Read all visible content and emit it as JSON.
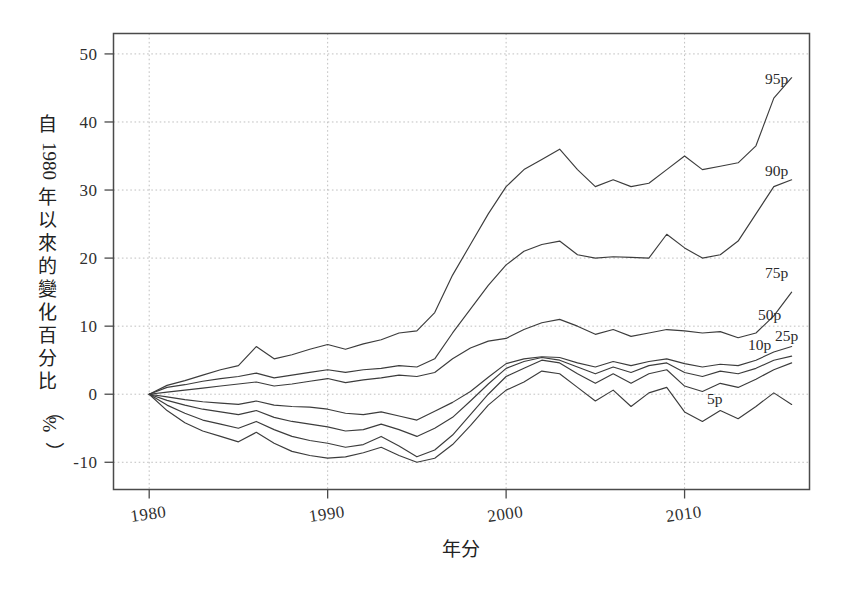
{
  "chart_data": {
    "type": "line",
    "title": "",
    "xlabel": "年分",
    "ylabel": "自 1980 年以來的變化百分比（%）",
    "ylabel_chars": [
      "自",
      "1",
      "9",
      "8",
      "0",
      "年",
      "以",
      "來",
      "的",
      "變",
      "化",
      "百",
      "分",
      "比",
      "（",
      "%",
      "）"
    ],
    "xlim": [
      1979,
      1980.5
    ],
    "x_axis_range": [
      1978.0,
      1519.0
    ],
    "xlim_years": [
      1978,
      2017
    ],
    "ylim": [
      -14,
      53
    ],
    "grid": true,
    "legend_position": "right-inline",
    "xticks": [
      1980,
      1990,
      2000,
      2010
    ],
    "xtick_labels": [
      "1980",
      "1990",
      "2000",
      "2010"
    ],
    "yticks": [
      -10,
      0,
      10,
      20,
      30,
      40,
      50
    ],
    "ytick_labels": [
      "-10",
      "0",
      "10",
      "20",
      "30",
      "40",
      "50"
    ],
    "x": [
      1980,
      1981,
      1982,
      1983,
      1984,
      1985,
      1986,
      1987,
      1988,
      1989,
      1990,
      1991,
      1992,
      1993,
      1994,
      1995,
      1996,
      1997,
      1998,
      1999,
      2000,
      2001,
      2002,
      2003,
      2004,
      2005,
      2006,
      2007,
      2008,
      2009,
      2010,
      2011,
      2012,
      2013,
      2014,
      2015,
      2016
    ],
    "series": [
      {
        "name": "95p",
        "label": "95p",
        "label_value": 46.5,
        "values": [
          0,
          1.3,
          2.0,
          2.8,
          3.6,
          4.2,
          7.0,
          5.2,
          5.8,
          6.6,
          7.3,
          6.6,
          7.4,
          8.0,
          9.0,
          9.3,
          12.0,
          17.5,
          22.0,
          26.5,
          30.5,
          33.0,
          34.5,
          36.0,
          33.0,
          30.5,
          31.5,
          30.5,
          31.0,
          33.0,
          35.0,
          33.0,
          33.5,
          34.0,
          36.5,
          43.5,
          46.5
        ]
      },
      {
        "name": "90p",
        "label": "90p",
        "label_value": 31.5,
        "values": [
          0,
          1.0,
          1.4,
          1.9,
          2.3,
          2.6,
          3.1,
          2.4,
          2.8,
          3.2,
          3.6,
          3.2,
          3.6,
          3.8,
          4.2,
          4.0,
          5.2,
          9.0,
          12.5,
          16.0,
          19.0,
          21.0,
          22.0,
          22.5,
          20.5,
          20.0,
          20.2,
          20.1,
          20.0,
          23.5,
          21.5,
          20.0,
          20.5,
          22.5,
          26.5,
          30.5,
          31.5
        ]
      },
      {
        "name": "75p",
        "label": "75p",
        "label_value": 15.0,
        "values": [
          0,
          0.3,
          0.6,
          0.9,
          1.2,
          1.5,
          1.8,
          1.2,
          1.5,
          1.9,
          2.3,
          1.7,
          2.1,
          2.4,
          2.8,
          2.6,
          3.2,
          5.2,
          6.8,
          7.8,
          8.2,
          9.5,
          10.5,
          11.0,
          10.0,
          8.8,
          9.5,
          8.5,
          9.0,
          9.5,
          9.3,
          9.0,
          9.2,
          8.3,
          9.0,
          11.5,
          15.0
        ]
      },
      {
        "name": "50p",
        "label": "50p",
        "label_value": 7.0,
        "values": [
          0,
          -0.4,
          -0.8,
          -1.1,
          -1.3,
          -1.5,
          -1.0,
          -1.6,
          -1.8,
          -1.9,
          -2.2,
          -2.8,
          -3.0,
          -2.6,
          -3.2,
          -3.8,
          -2.5,
          -1.2,
          0.4,
          2.5,
          4.5,
          5.2,
          5.5,
          5.4,
          4.6,
          4.0,
          4.8,
          4.2,
          4.8,
          5.2,
          4.5,
          4.0,
          4.4,
          4.2,
          5.0,
          6.2,
          7.0
        ]
      },
      {
        "name": "25p",
        "label": "25p",
        "label_value": 5.6,
        "values": [
          0,
          -0.9,
          -1.6,
          -2.2,
          -2.6,
          -3.0,
          -2.4,
          -3.4,
          -4.0,
          -4.4,
          -4.8,
          -5.4,
          -5.2,
          -4.4,
          -5.2,
          -6.2,
          -5.0,
          -3.4,
          -1.0,
          1.5,
          3.8,
          4.8,
          5.4,
          5.0,
          4.0,
          3.0,
          4.0,
          3.2,
          4.2,
          4.6,
          3.2,
          2.6,
          3.4,
          3.0,
          3.8,
          5.0,
          5.6
        ]
      },
      {
        "name": "10p",
        "label": "10p",
        "label_value": 4.6,
        "values": [
          0,
          -1.6,
          -2.8,
          -3.8,
          -4.4,
          -5.0,
          -4.0,
          -5.2,
          -6.2,
          -6.8,
          -7.2,
          -7.8,
          -7.4,
          -6.2,
          -7.6,
          -9.2,
          -8.2,
          -6.0,
          -3.0,
          0.0,
          2.6,
          3.8,
          5.0,
          4.6,
          3.0,
          1.6,
          3.0,
          1.6,
          3.0,
          3.6,
          1.2,
          0.4,
          1.6,
          1.0,
          2.2,
          3.6,
          4.6
        ]
      },
      {
        "name": "5p",
        "label": "5p",
        "label_value": -1.5,
        "values": [
          0,
          -2.4,
          -4.2,
          -5.4,
          -6.2,
          -7.0,
          -5.6,
          -7.2,
          -8.4,
          -9.0,
          -9.4,
          -9.2,
          -8.6,
          -7.8,
          -9.0,
          -10.0,
          -9.4,
          -7.4,
          -4.6,
          -1.6,
          0.6,
          1.8,
          3.4,
          3.0,
          1.0,
          -1.0,
          0.6,
          -1.8,
          0.2,
          1.0,
          -2.6,
          -4.0,
          -2.4,
          -3.6,
          -1.8,
          0.2,
          -1.5
        ]
      }
    ]
  },
  "series_labels": [
    {
      "name": "95p",
      "text": "95p",
      "x": 765,
      "y": 84
    },
    {
      "name": "90p",
      "text": "90p",
      "x": 765,
      "y": 176
    },
    {
      "name": "75p",
      "text": "75p",
      "x": 765,
      "y": 278
    },
    {
      "name": "50p",
      "text": "50p",
      "x": 758,
      "y": 320
    },
    {
      "name": "25p",
      "text": "25p",
      "x": 775,
      "y": 341
    },
    {
      "name": "10p",
      "text": "10p",
      "x": 748,
      "y": 350
    },
    {
      "name": "5p",
      "text": "5p",
      "x": 707,
      "y": 404
    }
  ]
}
